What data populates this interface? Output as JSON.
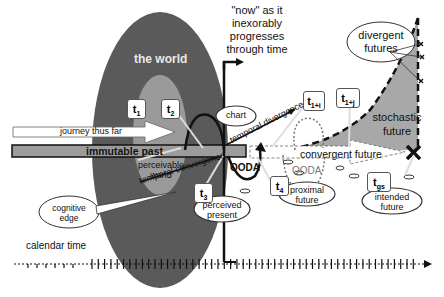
{
  "labels": {
    "world": "the world",
    "now_caption_1": "\"now\" as it",
    "now_caption_2": "inexorably",
    "now_caption_3": "progresses",
    "now_caption_4": "through time",
    "journey": "journey thus far",
    "immutable_past": "immutable past",
    "perceivable_world_1": "perceivable",
    "perceivable_world_2": "world",
    "temporal_convergence": "temporal convergence",
    "temporal_divergence": "temporal divergence",
    "chart": "chart",
    "ooda_left": "OODA",
    "ooda_right": "OODA",
    "convergent_future": "convergent future",
    "stochastic_future_1": "stochastic",
    "stochastic_future_2": "future",
    "divergent_futures_1": "divergent",
    "divergent_futures_2": "futures",
    "cognitive_edge_1": "cognitive",
    "cognitive_edge_2": "edge",
    "perceived_present_1": "perceived",
    "perceived_present_2": "present",
    "proximal_future_1": "proximal",
    "proximal_future_2": "future",
    "intended_future_1": "intended",
    "intended_future_2": "future",
    "calendar_time": "calendar time"
  },
  "time_markers": [
    {
      "base": "t",
      "sub": "1"
    },
    {
      "base": "t",
      "sub": "2"
    },
    {
      "base": "t",
      "sub": "3"
    },
    {
      "base": "t",
      "sub": "4"
    },
    {
      "base": "t",
      "sub": "1+i"
    },
    {
      "base": "t",
      "sub": "1+j"
    },
    {
      "base": "t",
      "sub": "gs"
    }
  ],
  "colors": {
    "world": "#5a5a5a",
    "perceivable": "#9a9a9a",
    "stochastic": "#a8a8a8",
    "past_band": "#9c9c9c",
    "ink": "#111111"
  }
}
